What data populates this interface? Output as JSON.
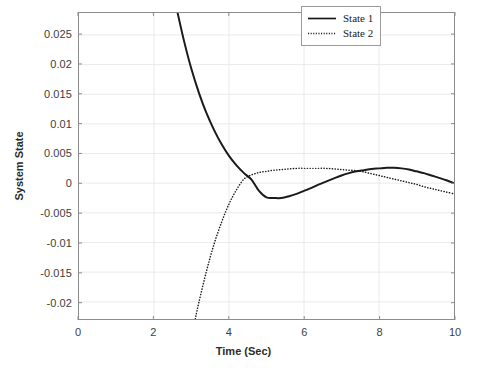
{
  "chart_data": {
    "type": "line",
    "title": "",
    "xlabel": "Time (Sec)",
    "ylabel": "System State",
    "xlim": [
      0,
      10
    ],
    "ylim": [
      -0.0229,
      0.0287
    ],
    "xticks": [
      0,
      2,
      4,
      6,
      8,
      10
    ],
    "xtick_labels": [
      "0",
      "2",
      "4",
      "6",
      "8",
      "10"
    ],
    "yticks": [
      0.025,
      0.02,
      0.015,
      0.01,
      0.005,
      0,
      -0.005,
      -0.01,
      -0.015,
      -0.02
    ],
    "ytick_labels": [
      "0.025",
      "0.02",
      "0.015",
      "0.01",
      "0.005",
      "0",
      "-0.005",
      "-0.01",
      "-0.015",
      "-0.02"
    ],
    "grid": true,
    "legend_position": "top-right",
    "series": [
      {
        "name": "State 1",
        "style": "solid",
        "color": "#1a1a1a",
        "x": [
          2.63,
          2.8,
          3.0,
          3.2,
          3.4,
          3.6,
          3.8,
          4.0,
          4.2,
          4.4,
          4.6,
          4.8,
          5.0,
          5.2,
          5.4,
          5.6,
          5.8,
          6.0,
          6.2,
          6.4,
          6.6,
          6.8,
          7.0,
          7.2,
          7.4,
          7.6,
          7.8,
          8.0,
          8.2,
          8.4,
          8.6,
          8.8,
          9.0,
          9.2,
          9.4,
          9.6,
          9.8,
          10.0
        ],
        "y": [
          0.0287,
          0.024,
          0.0192,
          0.0152,
          0.0118,
          0.009,
          0.0066,
          0.0046,
          0.003,
          0.0017,
          0.0006,
          -0.0013,
          -0.0024,
          -0.0025,
          -0.0025,
          -0.0022,
          -0.0018,
          -0.0013,
          -0.0008,
          -0.0002,
          0.0003,
          0.0008,
          0.0013,
          0.0017,
          0.002,
          0.0022,
          0.0024,
          0.0025,
          0.0026,
          0.0026,
          0.0025,
          0.0023,
          0.002,
          0.0017,
          0.0013,
          0.0009,
          0.0005,
          0.0
        ]
      },
      {
        "name": "State 2",
        "style": "dotted",
        "color": "#1a1a1a",
        "x": [
          3.1,
          3.2,
          3.4,
          3.6,
          3.8,
          4.0,
          4.2,
          4.4,
          4.6,
          4.8,
          5.0,
          5.2,
          5.4,
          5.6,
          5.8,
          6.0,
          6.2,
          6.4,
          6.6,
          6.8,
          7.0,
          7.2,
          7.4,
          7.6,
          7.8,
          8.0,
          8.2,
          8.4,
          8.6,
          8.8,
          9.0,
          9.2,
          9.4,
          9.6,
          9.8,
          10.0
        ],
        "y": [
          -0.0229,
          -0.02,
          -0.0148,
          -0.0103,
          -0.0066,
          -0.0035,
          -0.0011,
          0.0007,
          0.0014,
          0.0018,
          0.002,
          0.0022,
          0.0023,
          0.0024,
          0.0025,
          0.0025,
          0.0025,
          0.0025,
          0.0025,
          0.0024,
          0.0023,
          0.0022,
          0.0021,
          0.0019,
          0.0016,
          0.0013,
          0.001,
          0.0007,
          0.0004,
          0.0001,
          -0.0002,
          -0.0006,
          -0.0009,
          -0.0012,
          -0.0015,
          -0.0018
        ]
      }
    ]
  },
  "legend": {
    "entries": [
      {
        "label": "State 1"
      },
      {
        "label": "State 2"
      }
    ]
  },
  "colors": {
    "axis": "#8c8c8c",
    "grid": "#eaeaea",
    "tick_text": "#3d3d3d",
    "label_text": "#2b2b2b",
    "curve": "#1a1a1a"
  }
}
